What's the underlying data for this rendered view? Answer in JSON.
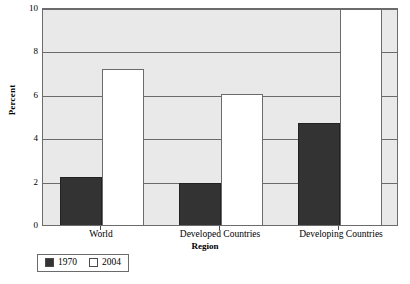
{
  "chart_data": {
    "type": "bar",
    "title": "",
    "xlabel": "Region",
    "ylabel": "Percent",
    "categories": [
      "World",
      "Developed Countries",
      "Developing Countries"
    ],
    "series": [
      {
        "name": "1970",
        "color": "#333333",
        "values": [
          2.3,
          2.0,
          4.75
        ]
      },
      {
        "name": "2004",
        "color": "#ffffff",
        "values": [
          7.25,
          6.1,
          10.4
        ]
      }
    ],
    "ylim": [
      0,
      10
    ],
    "yticks": [
      0,
      2,
      4,
      6,
      8,
      10
    ],
    "ytick_labels": [
      "0",
      "2",
      "4",
      "6",
      "8",
      "10"
    ],
    "grid": "horizontal",
    "legend_position": "below-left"
  },
  "axes": {
    "y_title": "Percent",
    "x_title": "Region"
  },
  "legend": {
    "entries": [
      {
        "label": "1970",
        "swatch": "dark"
      },
      {
        "label": "2004",
        "swatch": "light"
      }
    ]
  }
}
